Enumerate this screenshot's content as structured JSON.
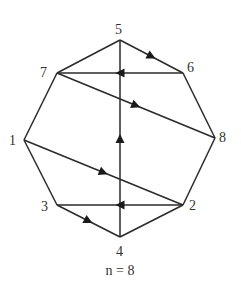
{
  "diagram": {
    "caption": "n = 8",
    "vertices": [
      {
        "id": "1",
        "label": "1",
        "x": 24,
        "y": 140,
        "lx": 9,
        "ly": 145
      },
      {
        "id": "2",
        "label": "2",
        "x": 183,
        "y": 205,
        "lx": 189,
        "ly": 210
      },
      {
        "id": "3",
        "label": "3",
        "x": 57,
        "y": 205,
        "lx": 41,
        "ly": 211
      },
      {
        "id": "4",
        "label": "4",
        "x": 120,
        "y": 237,
        "lx": 116,
        "ly": 256
      },
      {
        "id": "5",
        "label": "5",
        "x": 120,
        "y": 40,
        "lx": 115,
        "ly": 34
      },
      {
        "id": "6",
        "label": "6",
        "x": 183,
        "y": 73,
        "lx": 187,
        "ly": 72
      },
      {
        "id": "7",
        "label": "7",
        "x": 57,
        "y": 73,
        "lx": 40,
        "ly": 77
      },
      {
        "id": "8",
        "label": "8",
        "x": 215,
        "y": 138,
        "lx": 219,
        "ly": 142
      }
    ],
    "edges": [
      {
        "from": "5",
        "to": "6",
        "directed": true
      },
      {
        "from": "6",
        "to": "7",
        "directed": true
      },
      {
        "from": "7",
        "to": "8",
        "directed": true
      },
      {
        "from": "1",
        "to": "2",
        "directed": true
      },
      {
        "from": "2",
        "to": "3",
        "directed": true
      },
      {
        "from": "3",
        "to": "4",
        "directed": true
      },
      {
        "from": "4",
        "to": "5",
        "directed": true
      },
      {
        "from": "5",
        "to": "7",
        "directed": false
      },
      {
        "from": "7",
        "to": "1",
        "directed": false
      },
      {
        "from": "1",
        "to": "3",
        "directed": false
      },
      {
        "from": "4",
        "to": "2",
        "directed": false
      },
      {
        "from": "2",
        "to": "8",
        "directed": false
      },
      {
        "from": "8",
        "to": "6",
        "directed": false
      }
    ]
  }
}
